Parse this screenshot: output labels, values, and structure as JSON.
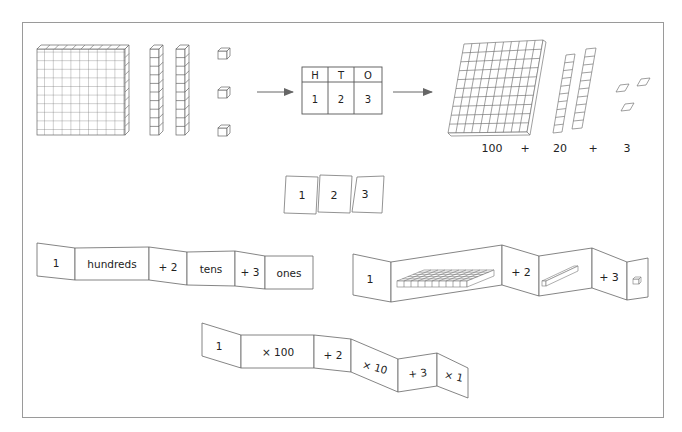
{
  "diagram": {
    "colors": {
      "stroke": "#555555",
      "frame": "#9a9a9a",
      "arrow": "#666666",
      "text": "#222222"
    },
    "row1": {
      "blocks": {
        "hundreds_flats": 1,
        "tens_rods": 2,
        "ones_cubes": 3
      },
      "place_value_table": {
        "headers": [
          "H",
          "T",
          "O"
        ],
        "values": [
          "1",
          "2",
          "3"
        ]
      },
      "expanded": {
        "terms": [
          "100",
          "+",
          "20",
          "+",
          "3"
        ]
      }
    },
    "cards": [
      "1",
      "2",
      "3"
    ],
    "strip_words": {
      "panels": [
        "1",
        "hundreds",
        "+ 2",
        "tens",
        "+ 3",
        "ones"
      ]
    },
    "strip_pictures": {
      "panels": [
        "1",
        "hundreds-flat-icon",
        "+ 2",
        "tens-rod-icon",
        "+ 3",
        "ones-cube-icon"
      ]
    },
    "strip_multiply": {
      "panels": [
        "1",
        "× 100",
        "+ 2",
        "× 10",
        "+ 3",
        "× 1"
      ]
    }
  }
}
